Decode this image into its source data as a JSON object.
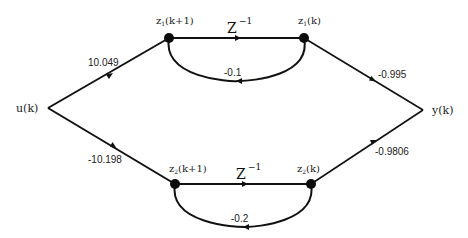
{
  "diagram": {
    "type": "signal-flow-graph",
    "input": {
      "label": "u(k)"
    },
    "output": {
      "label": "y(k)"
    },
    "nodes": {
      "z1_next": {
        "label_main": "z",
        "label_sub": "1",
        "label_arg": "(k+1)"
      },
      "z1": {
        "label_main": "z",
        "label_sub": "1",
        "label_arg": "(k)"
      },
      "z2_next": {
        "label_main": "z",
        "label_sub": "2",
        "label_arg": "(k+1)"
      },
      "z2": {
        "label_main": "z",
        "label_sub": "2",
        "label_arg": "(k)"
      }
    },
    "branches": {
      "input_to_z1": {
        "gain": "10.049"
      },
      "input_to_z2": {
        "gain": "-10.198"
      },
      "z1_delay": {
        "base": "Z",
        "exp": "−1"
      },
      "z2_delay": {
        "base": "Z",
        "exp": "−1"
      },
      "z1_feedback": {
        "gain": "-0.1"
      },
      "z2_feedback": {
        "gain": "-0.2"
      },
      "z1_to_output": {
        "gain": "-0.995"
      },
      "z2_to_output": {
        "gain": "-0.9806"
      }
    },
    "colors": {
      "line": "#111111",
      "node": "#0d0d0d",
      "text": "#222222",
      "background": "#ffffff"
    }
  }
}
